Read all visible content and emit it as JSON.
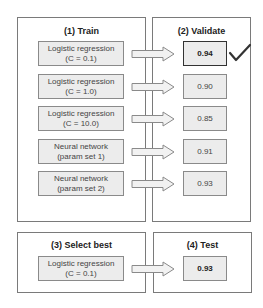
{
  "panels": {
    "train": {
      "title": "(1) Train"
    },
    "validate": {
      "title": "(2) Validate"
    },
    "select": {
      "title": "(3) Select best"
    },
    "test": {
      "title": "(4) Test"
    }
  },
  "models": [
    {
      "line1": "Logistic regression",
      "line2": "(C = 0.1)",
      "score": "0.94",
      "best": true
    },
    {
      "line1": "Logistic regression",
      "line2": "(C = 1.0)",
      "score": "0.90",
      "best": false
    },
    {
      "line1": "Logistic regression",
      "line2": "(C = 10.0)",
      "score": "0.85",
      "best": false
    },
    {
      "line1": "Neural network",
      "line2": "(param set 1)",
      "score": "0.91",
      "best": false
    },
    {
      "line1": "Neural network",
      "line2": "(param set 2)",
      "score": "0.93",
      "best": false
    }
  ],
  "selected": {
    "line1": "Logistic regression",
    "line2": "(C = 0.1)"
  },
  "test_score": "0.93",
  "icons": {
    "arrow": "right-arrow-icon",
    "check": "checkmark-icon"
  },
  "colors": {
    "border": "#7a7a7a",
    "box_fill": "#ececec",
    "best_border": "#333333",
    "check": "#333333"
  }
}
